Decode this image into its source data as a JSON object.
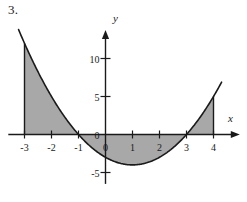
{
  "figure": {
    "number_label": "3.",
    "axis_labels": {
      "x": "x",
      "y": "y"
    }
  },
  "chart_data": {
    "type": "line",
    "title": "",
    "xlabel": "x",
    "ylabel": "y",
    "grid": false,
    "legend": null,
    "xlim": [
      -3.6,
      4.9
    ],
    "ylim": [
      -6.5,
      13.5
    ],
    "x_ticks": [
      -3,
      -2,
      -1,
      0,
      1,
      2,
      3,
      4
    ],
    "x_tick_labels": [
      "-3",
      "-2",
      "-1",
      "0",
      "1",
      "2",
      "3",
      "4"
    ],
    "y_ticks": [
      -5,
      0,
      5,
      10
    ],
    "y_tick_labels": [
      "-5",
      "0",
      "5",
      "10"
    ],
    "series": [
      {
        "name": "y = x^2 - 2x - 3",
        "equation": "y = x^2 - 2x - 3",
        "roots": [
          -1,
          3
        ],
        "vertex": [
          1,
          -4
        ],
        "x": [
          -3,
          -2.5,
          -2,
          -1.5,
          -1,
          -0.5,
          0,
          0.5,
          1,
          1.5,
          2,
          2.5,
          3,
          3.5,
          4
        ],
        "values": [
          12,
          8.25,
          5,
          2.25,
          0,
          -1.75,
          -3,
          -3.75,
          -4,
          -3.75,
          -3,
          -1.75,
          0,
          2.25,
          5
        ]
      }
    ],
    "shaded_regions": [
      {
        "name": "left-region",
        "x_from": -3,
        "x_to": -1,
        "above_axis": true,
        "area": 9.333
      },
      {
        "name": "middle-region",
        "x_from": -1,
        "x_to": 3,
        "above_axis": false,
        "area": 10.667
      },
      {
        "name": "right-region",
        "x_from": 3,
        "x_to": 4,
        "above_axis": true,
        "area": 1.667
      }
    ],
    "boundary_lines": [
      {
        "name": "left-boundary",
        "x": -3,
        "y_from": 0,
        "y_to": 12
      },
      {
        "name": "right-boundary",
        "x": 4,
        "y_from": 0,
        "y_to": 5
      }
    ],
    "colors": {
      "curve": "#1a1a1a",
      "axis": "#1a1a1a",
      "shading": "#a8a8a8",
      "background": "#ffffff"
    }
  }
}
